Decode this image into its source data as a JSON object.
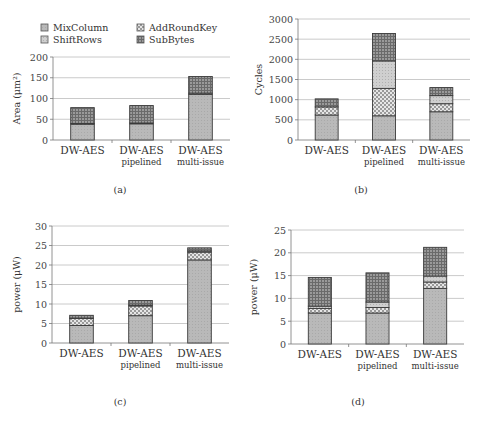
{
  "legend": {
    "items": [
      {
        "name": "MixColumn",
        "pattern": "solid-light"
      },
      {
        "name": "AddRoundKey",
        "pattern": "crosshatch-dots"
      },
      {
        "name": "ShiftRows",
        "pattern": "light-dots"
      },
      {
        "name": "SubBytes",
        "pattern": "dark-grid"
      }
    ]
  },
  "colors": {
    "mixcolumn": "#b8b8b8",
    "addroundkey": "#d6d6d6",
    "shiftrows": "#c4c4c4",
    "subbytes": "#8a8a8a",
    "outline": "#3a3a3a",
    "grid": "#bdbdbd"
  },
  "chart_data": [
    {
      "id": "a",
      "type": "bar",
      "stacked": true,
      "caption": "(a)",
      "ylabel": "Area (μm²)",
      "ylim": [
        0,
        200
      ],
      "yticks": [
        0,
        50,
        100,
        150,
        200
      ],
      "categories": [
        {
          "line1": "DW-AES",
          "line2": ""
        },
        {
          "line1": "DW-AES",
          "line2": "pipelined"
        },
        {
          "line1": "DW-AES",
          "line2": "multi-issue"
        }
      ],
      "series": [
        {
          "name": "MixColumn",
          "values": [
            38,
            39,
            110
          ]
        },
        {
          "name": "AddRoundKey",
          "values": [
            2,
            2,
            3
          ]
        },
        {
          "name": "ShiftRows",
          "values": [
            0,
            0,
            0
          ]
        },
        {
          "name": "SubBytes",
          "values": [
            38,
            42,
            40
          ]
        }
      ],
      "grid": true
    },
    {
      "id": "b",
      "type": "bar",
      "stacked": true,
      "caption": "(b)",
      "ylabel": "Cycles",
      "ylim": [
        0,
        3000
      ],
      "yticks": [
        0,
        500,
        1000,
        1500,
        2000,
        2500,
        3000
      ],
      "categories": [
        {
          "line1": "DW-AES",
          "line2": ""
        },
        {
          "line1": "DW-AES",
          "line2": "pipelined"
        },
        {
          "line1": "DW-AES",
          "line2": "multi-issue"
        }
      ],
      "series": [
        {
          "name": "MixColumn",
          "values": [
            620,
            600,
            700
          ]
        },
        {
          "name": "AddRoundKey",
          "values": [
            200,
            680,
            200
          ]
        },
        {
          "name": "ShiftRows",
          "values": [
            0,
            680,
            200
          ]
        },
        {
          "name": "SubBytes",
          "values": [
            200,
            680,
            200
          ]
        }
      ],
      "grid": true
    },
    {
      "id": "c",
      "type": "bar",
      "stacked": true,
      "caption": "(c)",
      "ylabel": "power (μW)",
      "ylim": [
        0,
        30
      ],
      "yticks": [
        0,
        5,
        10,
        15,
        20,
        25,
        30
      ],
      "categories": [
        {
          "line1": "DW-AES",
          "line2": ""
        },
        {
          "line1": "DW-AES",
          "line2": "pipelined"
        },
        {
          "line1": "DW-AES",
          "line2": "multi-issue"
        }
      ],
      "series": [
        {
          "name": "MixColumn",
          "values": [
            4.5,
            7.0,
            21.3
          ]
        },
        {
          "name": "AddRoundKey",
          "values": [
            1.8,
            2.5,
            2.0
          ]
        },
        {
          "name": "ShiftRows",
          "values": [
            0.1,
            0.2,
            0.3
          ]
        },
        {
          "name": "SubBytes",
          "values": [
            0.7,
            1.2,
            0.8
          ]
        }
      ],
      "grid": true
    },
    {
      "id": "d",
      "type": "bar",
      "stacked": true,
      "caption": "(d)",
      "ylabel": "power (μW)",
      "ylim": [
        0,
        25
      ],
      "yticks": [
        0,
        5,
        10,
        15,
        20,
        25
      ],
      "categories": [
        {
          "line1": "DW-AES",
          "line2": ""
        },
        {
          "line1": "DW-AES",
          "line2": "pipelined"
        },
        {
          "line1": "DW-AES",
          "line2": "multi-issue"
        }
      ],
      "series": [
        {
          "name": "MixColumn",
          "values": [
            6.8,
            6.8,
            12.2
          ]
        },
        {
          "name": "AddRoundKey",
          "values": [
            1.0,
            1.2,
            1.4
          ]
        },
        {
          "name": "ShiftRows",
          "values": [
            0.5,
            1.2,
            1.3
          ]
        },
        {
          "name": "SubBytes",
          "values": [
            6.3,
            6.4,
            6.3
          ]
        }
      ],
      "grid": true
    }
  ]
}
